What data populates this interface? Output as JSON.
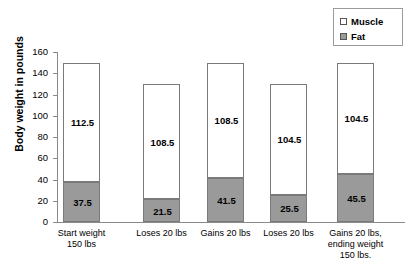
{
  "chart_data": {
    "type": "bar",
    "stacked": true,
    "title": "",
    "xlabel": "",
    "ylabel": "Body weight in pounds",
    "ylim": [
      0,
      160
    ],
    "yticks": [
      0,
      20,
      40,
      60,
      80,
      100,
      120,
      140,
      160
    ],
    "grid": false,
    "legend_position": "top-right",
    "categories": [
      "Start weight 150 lbs",
      "Loses 20 lbs",
      "Gains 20 lbs",
      "Loses 20 lbs",
      "Gains 20 lbs, ending weight 150 lbs."
    ],
    "category_lines": [
      [
        "Start weight",
        "150 lbs"
      ],
      [
        "Loses 20 lbs"
      ],
      [
        "Gains 20 lbs"
      ],
      [
        "Loses 20 lbs"
      ],
      [
        "Gains 20 lbs,",
        "ending weight",
        "150 lbs."
      ]
    ],
    "series": [
      {
        "name": "Fat",
        "color": "#9a9a9a",
        "values": [
          37.5,
          21.5,
          41.5,
          25.5,
          45.5
        ]
      },
      {
        "name": "Muscle",
        "color": "#ffffff",
        "values": [
          112.5,
          108.5,
          108.5,
          104.5,
          104.5
        ]
      }
    ],
    "totals": [
      150,
      130,
      150,
      130,
      150
    ],
    "legend": [
      {
        "label": "Muscle",
        "color": "#ffffff"
      },
      {
        "label": "Fat",
        "color": "#9a9a9a"
      }
    ]
  },
  "axis": {
    "y_title": "Body weight in pounds",
    "tick_labels": [
      "160",
      "140",
      "120",
      "100",
      "80",
      "60",
      "40",
      "20",
      "0"
    ]
  },
  "bar_labels": {
    "muscle": [
      "112.5",
      "108.5",
      "108.5",
      "104.5",
      "104.5"
    ],
    "fat": [
      "37.5",
      "21.5",
      "41.5",
      "25.5",
      "45.5"
    ]
  },
  "colors": {
    "fat": "#9a9a9a",
    "muscle": "#ffffff",
    "axis": "#8a8a8a",
    "bar_border": "#7a7a7a",
    "text": "#000000",
    "background": "#ffffff"
  }
}
